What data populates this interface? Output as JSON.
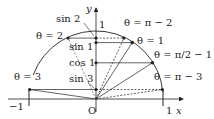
{
  "diagram": {
    "axes": {
      "x_label": "x",
      "y_label": "y",
      "origin_label": "O",
      "tick_neg1": "−1",
      "tick_pos1_x": "1",
      "tick_pos1_y": "1"
    },
    "angle_labels": {
      "theta_2": "θ = 2",
      "theta_pi_minus_2": "θ = π − 2",
      "theta_1": "θ = 1",
      "theta_half_pi_minus_1": "θ = π/2 − 1",
      "theta_3": "θ = 3",
      "theta_pi_minus_3": "θ = π − 3"
    },
    "y_axis_labels": {
      "sin2": "sin 2",
      "sin1": "sin 1",
      "cos1": "cos 1",
      "sin3": "sin 3"
    },
    "colors": {
      "line": "#222222",
      "background": "#ffffff"
    }
  }
}
